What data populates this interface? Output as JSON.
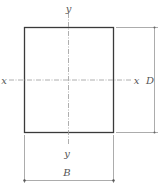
{
  "diagram": {
    "type": "rectangular cross-section with principal axes and dimensions",
    "colors": {
      "section_outline": "#3a3a3a",
      "axis_line": "#9a9a9a",
      "dimension_line": "#888888",
      "label": "#555555"
    },
    "axes": {
      "x_left_label": "x",
      "x_right_label": "x",
      "y_top_label": "y",
      "y_bottom_label": "y"
    },
    "dimensions": {
      "depth_label": "D",
      "breadth_label": "B"
    }
  }
}
